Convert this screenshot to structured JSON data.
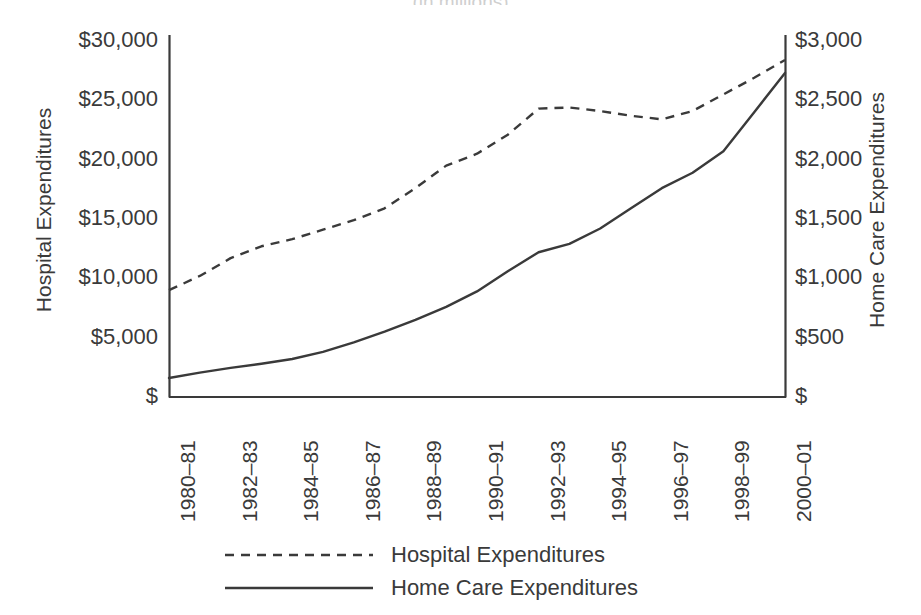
{
  "chart_data": {
    "type": "line",
    "title": "(in millions)",
    "xlabel": "",
    "ylabel": "Hospital Expenditures",
    "y2label": "Home Care Expenditures",
    "x": [
      "1980–81",
      "1981–82",
      "1982–83",
      "1983–84",
      "1984–85",
      "1985–86",
      "1986–87",
      "1987–88",
      "1988–89",
      "1989–90",
      "1990–91",
      "1991–92",
      "1992–93",
      "1993–94",
      "1994–95",
      "1995–96",
      "1996–97",
      "1997–98",
      "1998–99",
      "1999–00",
      "2000–01"
    ],
    "x_tick_labels": [
      "1980–81",
      "1982–83",
      "1984–85",
      "1986–87",
      "1988–89",
      "1990–91",
      "1992–93",
      "1994–95",
      "1996–97",
      "1998–99",
      "2000–01"
    ],
    "x_tick_indices": [
      0,
      2,
      4,
      6,
      8,
      10,
      12,
      14,
      16,
      18,
      20
    ],
    "ylim": [
      0,
      30000
    ],
    "y_ticks": [
      0,
      5000,
      10000,
      15000,
      20000,
      25000,
      30000
    ],
    "y_tick_labels": [
      "$",
      "$5,000",
      "$10,000",
      "$15,000",
      "$20,000",
      "$25,000",
      "$30,000"
    ],
    "y2lim": [
      0,
      3000
    ],
    "y2_ticks": [
      0,
      500,
      1000,
      1500,
      2000,
      2500,
      3000
    ],
    "y2_tick_labels": [
      "$",
      "$500",
      "$1,000",
      "$1,500",
      "$2,000",
      "$2,500",
      "$3,000"
    ],
    "grid": false,
    "legend_position": "bottom",
    "series": [
      {
        "name": "Hospital Expenditures",
        "axis": "left",
        "style": "dashed",
        "color": "#3a3a3a",
        "values": [
          9000,
          10200,
          11700,
          12700,
          13300,
          14100,
          14900,
          15900,
          17600,
          19500,
          20500,
          22100,
          24300,
          24400,
          24100,
          23700,
          23400,
          24100,
          25500,
          26900,
          28400
        ]
      },
      {
        "name": "Home Care Expenditures",
        "axis": "right",
        "style": "solid",
        "color": "#3a3a3a",
        "values": [
          160,
          205,
          245,
          280,
          320,
          380,
          460,
          550,
          650,
          760,
          890,
          1060,
          1220,
          1290,
          1420,
          1590,
          1760,
          1890,
          2070,
          2400,
          2730
        ]
      }
    ]
  },
  "legend": {
    "items": [
      {
        "label": "Hospital Expenditures",
        "style": "dashed"
      },
      {
        "label": "Home Care Expenditures",
        "style": "solid"
      }
    ]
  }
}
